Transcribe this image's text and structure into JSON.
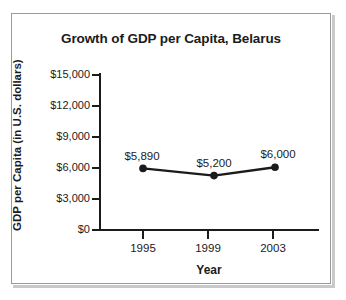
{
  "chart_data": {
    "type": "line",
    "title": "Growth of GDP per Capita, Belarus",
    "xlabel": "Year",
    "ylabel": "GDP per Capita (in U.S. dollars)",
    "categories": [
      "1995",
      "1999",
      "2003"
    ],
    "x": [
      1995,
      1999,
      2003
    ],
    "values": [
      5890,
      5200,
      6000
    ],
    "point_labels": [
      "$5,890",
      "$5,200",
      "$6,000"
    ],
    "ylim": [
      0,
      15000
    ],
    "yticks": [
      0,
      3000,
      6000,
      9000,
      12000,
      15000
    ],
    "ytick_labels": [
      "$0",
      "$3,000",
      "$6,000",
      "$9,000",
      "$12,000",
      "$15,000"
    ],
    "xticks": [
      1995,
      1999,
      2003
    ],
    "xtick_labels": [
      "1995",
      "1999",
      "2003"
    ],
    "grid": false,
    "legend": null,
    "series": [
      {
        "name": "GDP per Capita",
        "values": [
          5890,
          5200,
          6000
        ],
        "color": "#1b1b1b",
        "marker": "filled-circle"
      }
    ],
    "colors": {
      "line": "#1b1b1b",
      "marker": "#1b1b1b",
      "axis": "#1b1b1b",
      "text": "#1b1b1b",
      "frame_border": "#9a9a9a",
      "background": "#ffffff"
    }
  }
}
